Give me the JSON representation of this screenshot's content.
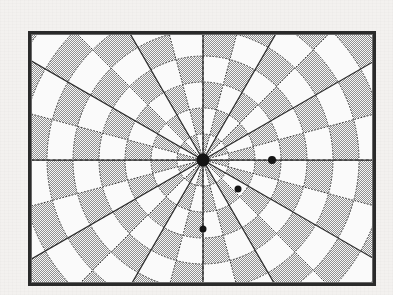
{
  "document": {
    "kind": "scanned-figure",
    "page_background_color": "#f3f1ef",
    "figure_background_color": "#fafafa"
  },
  "figure": {
    "name": "polar-checkerboard-target",
    "frame": {
      "x": 28,
      "y": 31,
      "width": 348,
      "height": 255,
      "border_color": "#2a2a2a",
      "border_width": 3,
      "inner_border_color": "#6a6a6a"
    },
    "colors": {
      "cell_shaded": "#a9a9a9",
      "cell_light": "#f7f7f7",
      "spoke_major": "#2b2b2b",
      "spoke_minor": "#3a3a3a",
      "ring_line": "#3a3a3a",
      "marker": "#151515",
      "axis": "#2b2b2b"
    }
  },
  "chart_data": {
    "type": "scatter",
    "title": "",
    "subtitle": "",
    "xlabel": "",
    "ylabel": "",
    "grid": true,
    "legend": null,
    "coordinate_system": "polar",
    "center": {
      "x": 203,
      "y": 160
    },
    "sector_count": 24,
    "sector_span_degrees": 15,
    "major_spoke_count": 12,
    "major_spoke_span_degrees": 30,
    "ring_count": 7,
    "ring_radii": [
      26,
      52,
      78,
      104,
      130,
      156,
      182,
      208,
      234
    ],
    "ring_spacing": 26,
    "ring_shading_pattern": "checkerboard",
    "axis_lines": [
      {
        "name": "horizontal-axis",
        "angle_degrees": 0
      },
      {
        "name": "vertical-axis",
        "angle_degrees": 90
      }
    ],
    "points": [
      {
        "label": "center-origin",
        "x": 203,
        "y": 160,
        "r": 0,
        "theta_degrees": 0,
        "radius_px": 6.5
      },
      {
        "label": "marker-east",
        "x": 272,
        "y": 160,
        "r": 69,
        "theta_degrees": 0,
        "radius_px": 4.0
      },
      {
        "label": "marker-southeast",
        "x": 238,
        "y": 189,
        "r": 45,
        "theta_degrees": -39,
        "radius_px": 3.5
      },
      {
        "label": "marker-south",
        "x": 203,
        "y": 229,
        "r": 69,
        "theta_degrees": -90,
        "radius_px": 3.5
      }
    ]
  }
}
